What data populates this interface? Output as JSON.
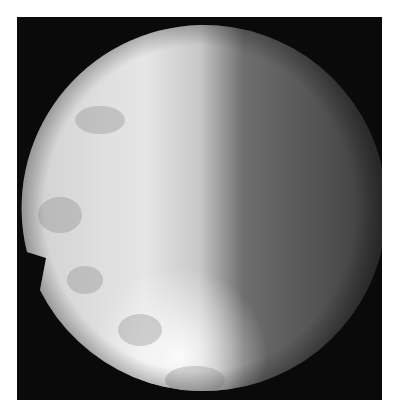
{
  "image": {
    "description": "Grayscale circular endoscopic/fluoroscopic view on black square background",
    "colors": {
      "background": "#ffffff",
      "frame": "#0a0a0a",
      "bright": "#f4f4f4",
      "dark": "#3a3a3a"
    }
  }
}
